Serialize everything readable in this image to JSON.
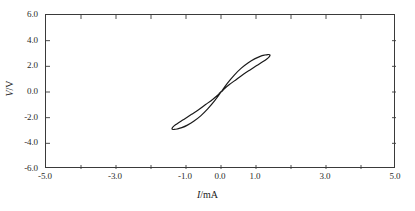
{
  "figure": {
    "background_color": "#ffffff",
    "axis_color": "#3a3a3a",
    "curve_color": "#1a1a1a"
  },
  "axis_titles": {
    "x_symbol": "I",
    "x_separator": "/mA",
    "x_full": "I/mA",
    "y_symbol": "V",
    "y_separator": "/V",
    "y_full": "V/V"
  },
  "ticks": {
    "x_labels": [
      "-5.0",
      "-3.0",
      "-1.0",
      "0.0",
      "1.0",
      "3.0",
      "5.0"
    ],
    "x_label_values": [
      -5,
      -3,
      -1,
      0,
      1,
      3,
      5
    ],
    "x_minor_values": [
      -4,
      -2,
      2,
      4
    ],
    "y_labels": [
      "6.0",
      "4.0",
      "2.0",
      "0.0",
      "-2.0",
      "-4.0",
      "-6.0"
    ],
    "y_label_values": [
      6,
      4,
      2,
      0,
      -2,
      -4,
      -6
    ]
  },
  "chart_data": {
    "type": "line",
    "title": "",
    "subtitle": "",
    "xlabel": "I/mA",
    "ylabel": "V/V",
    "xlim": [
      -5.0,
      5.0
    ],
    "ylim": [
      -6.0,
      6.0
    ],
    "grid": false,
    "legend": "none",
    "annotations": [],
    "series": [
      {
        "name": "Hysteresis loop",
        "color": "#1a1a1a",
        "line_width": 1.2,
        "closed": true,
        "x": [
          0.0,
          0.18,
          0.38,
          0.58,
          0.78,
          0.96,
          1.12,
          1.25,
          1.34,
          1.39,
          1.4,
          1.37,
          1.3,
          1.18,
          1.02,
          0.84,
          0.64,
          0.44,
          0.24,
          0.08,
          -0.02,
          -0.06,
          -0.04,
          0.0,
          -0.18,
          -0.38,
          -0.58,
          -0.78,
          -0.96,
          -1.12,
          -1.25,
          -1.34,
          -1.39,
          -1.4,
          -1.37,
          -1.3,
          -1.18,
          -1.02,
          -0.84,
          -0.64,
          -0.44,
          -0.24,
          -0.08,
          0.02,
          0.06,
          0.04,
          0.0
        ],
        "y": [
          0.0,
          0.68,
          1.32,
          1.86,
          2.28,
          2.58,
          2.78,
          2.88,
          2.92,
          2.9,
          2.84,
          2.72,
          2.56,
          2.34,
          2.06,
          1.74,
          1.38,
          0.98,
          0.58,
          0.22,
          -0.05,
          -0.14,
          -0.08,
          0.0,
          -0.68,
          -1.32,
          -1.86,
          -2.28,
          -2.58,
          -2.78,
          -2.88,
          -2.92,
          -2.9,
          -2.84,
          -2.72,
          -2.56,
          -2.34,
          -2.06,
          -1.74,
          -1.38,
          -0.98,
          -0.58,
          -0.22,
          0.05,
          0.14,
          0.08,
          0.0
        ],
        "extents": {
          "x_min": -1.4,
          "x_max": 1.4,
          "y_min": -2.92,
          "y_max": 2.92,
          "pinch_point": [
            0.0,
            0.0
          ]
        }
      }
    ]
  }
}
